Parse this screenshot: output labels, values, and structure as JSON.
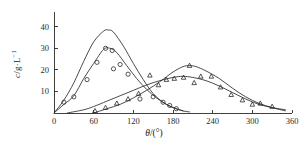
{
  "chart_data": {
    "type": "line",
    "title": "",
    "xlabel": "θ/(°)",
    "ylabel": "c/g·L⁻¹",
    "xlim": [
      0,
      360
    ],
    "ylim": [
      0,
      45
    ],
    "xticks": [
      0,
      60,
      120,
      180,
      240,
      300,
      360
    ],
    "xticklabels": [
      "0",
      "60",
      "120",
      "180",
      "240",
      "300",
      "360"
    ],
    "yticks": [
      10,
      20,
      30,
      40
    ],
    "yticklabels": [
      "10",
      "20",
      "30",
      "40"
    ],
    "grid": false,
    "legend": "none",
    "series": [
      {
        "name": "curve-1-upper-early-peak",
        "marker": "none",
        "x": [
          0,
          15,
          30,
          45,
          60,
          75,
          82,
          90,
          105,
          120,
          135,
          150,
          165,
          180,
          195,
          205
        ],
        "values": [
          0,
          6,
          14,
          24,
          33,
          38,
          38.5,
          37.5,
          31,
          23,
          15.5,
          9,
          5,
          2.5,
          1,
          0.5
        ]
      },
      {
        "name": "curve-2-circles-early-peak",
        "marker": "circle",
        "x": [
          0,
          15,
          30,
          45,
          60,
          75,
          85,
          95,
          110,
          125,
          140,
          155,
          170,
          185,
          195
        ],
        "values": [
          0,
          4,
          8,
          16,
          23,
          29.5,
          30,
          28,
          22,
          16,
          11,
          7,
          4,
          2,
          1
        ]
      },
      {
        "name": "curve-3-upper-late-peak",
        "marker": "none",
        "x": [
          60,
          80,
          100,
          120,
          140,
          160,
          180,
          195,
          205,
          215,
          230,
          250,
          270,
          290,
          310,
          330,
          350
        ],
        "values": [
          0,
          2,
          4,
          7,
          10.5,
          14.5,
          19,
          21.5,
          22,
          21.5,
          19.5,
          16,
          11.5,
          7.5,
          4.5,
          2.5,
          1
        ]
      },
      {
        "name": "curve-4-triangles-late-peak",
        "marker": "triangle",
        "x": [
          20,
          45,
          60,
          80,
          100,
          120,
          140,
          160,
          180,
          195,
          210,
          230,
          250,
          270,
          290,
          310,
          330,
          350
        ],
        "values": [
          0,
          1.5,
          3,
          5.5,
          8,
          10.5,
          13,
          15,
          16.5,
          17,
          16.5,
          15,
          12.5,
          9.5,
          6.5,
          4,
          2.5,
          1.5
        ]
      }
    ],
    "points_circle": [
      {
        "x": 15,
        "y": 5
      },
      {
        "x": 30,
        "y": 7.5
      },
      {
        "x": 50,
        "y": 15.5
      },
      {
        "x": 65,
        "y": 23.5
      },
      {
        "x": 78,
        "y": 30
      },
      {
        "x": 88,
        "y": 29
      },
      {
        "x": 90,
        "y": 20.5
      },
      {
        "x": 100,
        "y": 22.5
      },
      {
        "x": 112,
        "y": 18
      },
      {
        "x": 130,
        "y": 6.5
      },
      {
        "x": 150,
        "y": 7.5
      },
      {
        "x": 165,
        "y": 5
      },
      {
        "x": 175,
        "y": 3.5
      },
      {
        "x": 185,
        "y": 2
      }
    ],
    "points_triangle": [
      {
        "x": 62,
        "y": 1
      },
      {
        "x": 78,
        "y": 2.5
      },
      {
        "x": 95,
        "y": 4.5
      },
      {
        "x": 112,
        "y": 6.5
      },
      {
        "x": 128,
        "y": 9
      },
      {
        "x": 145,
        "y": 17.5
      },
      {
        "x": 158,
        "y": 13
      },
      {
        "x": 170,
        "y": 15.5
      },
      {
        "x": 182,
        "y": 16
      },
      {
        "x": 196,
        "y": 16.5
      },
      {
        "x": 205,
        "y": 22
      },
      {
        "x": 212,
        "y": 14
      },
      {
        "x": 222,
        "y": 17
      },
      {
        "x": 238,
        "y": 17
      },
      {
        "x": 252,
        "y": 12
      },
      {
        "x": 268,
        "y": 8.5
      },
      {
        "x": 285,
        "y": 6
      },
      {
        "x": 300,
        "y": 4
      },
      {
        "x": 312,
        "y": 4.5
      },
      {
        "x": 330,
        "y": 3
      }
    ],
    "colors": {
      "axis": "#2b2b2b",
      "curve": "#2b2b2b",
      "marker": "#2b2b2b",
      "background": "#ffffff"
    }
  }
}
